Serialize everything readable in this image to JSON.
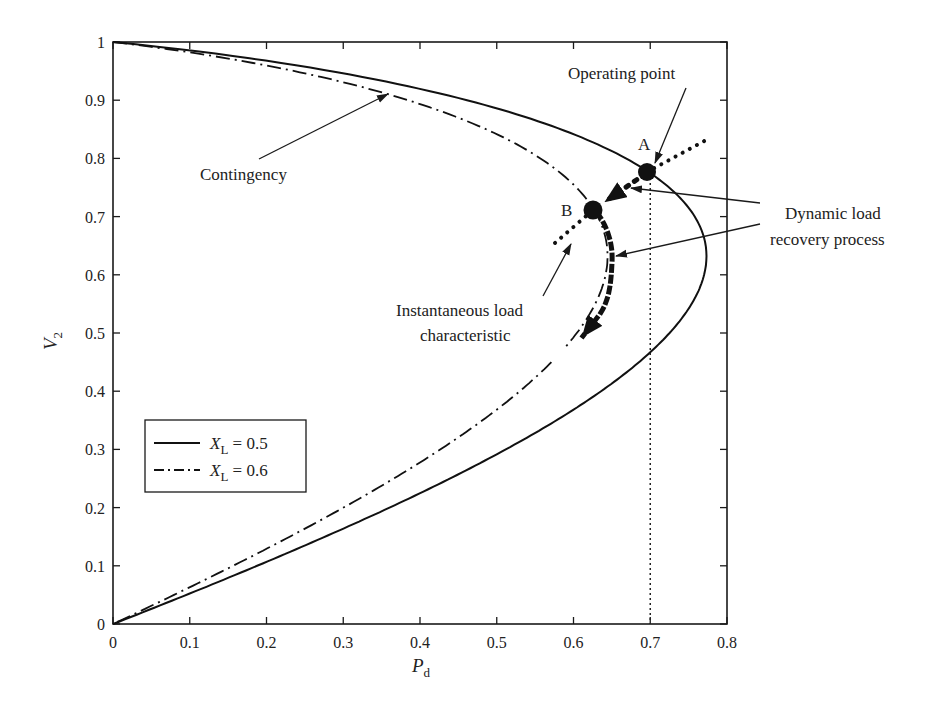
{
  "chart_data": {
    "type": "line",
    "title": "",
    "xlabel": "P",
    "xlabel_sub": "d",
    "ylabel": "V",
    "ylabel_sub": "2",
    "xlim": [
      0,
      0.8
    ],
    "ylim": [
      0,
      1
    ],
    "xticks": [
      "0",
      "0.1",
      "0.2",
      "0.3",
      "0.4",
      "0.5",
      "0.6",
      "0.7",
      "0.8"
    ],
    "yticks": [
      "0",
      "0.1",
      "0.2",
      "0.3",
      "0.4",
      "0.5",
      "0.6",
      "0.7",
      "0.8",
      "0.9",
      "1"
    ],
    "grid": false,
    "legend_position": "lower-left",
    "series": [
      {
        "name": "X_L = 0.5",
        "legend_var": "X",
        "legend_sub": "L",
        "legend_val": " = 0.5",
        "style": "solid",
        "X": 0.5,
        "tan_phi": 0.26,
        "nose": [
          0.775,
          0.632
        ],
        "points": [
          [
            0,
            1
          ],
          [
            0.2,
            0.975
          ],
          [
            0.4,
            0.935
          ],
          [
            0.6,
            0.86
          ],
          [
            0.694,
            0.78
          ],
          [
            0.775,
            0.632
          ],
          [
            0.72,
            0.5
          ],
          [
            0.6,
            0.39
          ],
          [
            0.4,
            0.24
          ],
          [
            0.2,
            0.115
          ],
          [
            0,
            0
          ]
        ]
      },
      {
        "name": "X_L = 0.6",
        "legend_var": "X",
        "legend_sub": "L",
        "legend_val": " = 0.6",
        "style": "dashdot",
        "X": 0.6,
        "tan_phi": 0.26,
        "nose": [
          0.646,
          0.632
        ],
        "points": [
          [
            0,
            1
          ],
          [
            0.2,
            0.965
          ],
          [
            0.35,
            0.915
          ],
          [
            0.5,
            0.835
          ],
          [
            0.627,
            0.711
          ],
          [
            0.62,
            0.6
          ],
          [
            0.59,
            0.476
          ],
          [
            0.4,
            0.29
          ],
          [
            0.2,
            0.14
          ],
          [
            0,
            0
          ]
        ]
      }
    ],
    "points_of_interest": [
      {
        "label": "A",
        "x": 0.69,
        "y": 0.78
      },
      {
        "label": "B",
        "x": 0.624,
        "y": 0.711
      }
    ],
    "reference_lines": [
      {
        "type": "vertical",
        "x": 0.7,
        "from_y": 0,
        "to_y": 0.78,
        "style": "dotted"
      }
    ],
    "annotations": [
      {
        "text": "Operating point",
        "target": "A"
      },
      {
        "text": "Contingency",
        "target": [
          0.355,
          0.915
        ]
      },
      {
        "text": "Dynamic load",
        "line": 1
      },
      {
        "text": "recovery process",
        "line": 2
      },
      {
        "text": "Instantaneous load",
        "line": 1
      },
      {
        "text": "characteristic",
        "line": 2
      }
    ]
  },
  "labels": {
    "point_a": "A",
    "point_b": "B",
    "operating_point": "Operating point",
    "contingency": "Contingency",
    "dynamic_line1": "Dynamic load",
    "dynamic_line2": "recovery process",
    "instant_line1": "Instantaneous load",
    "instant_line2": "characteristic"
  }
}
